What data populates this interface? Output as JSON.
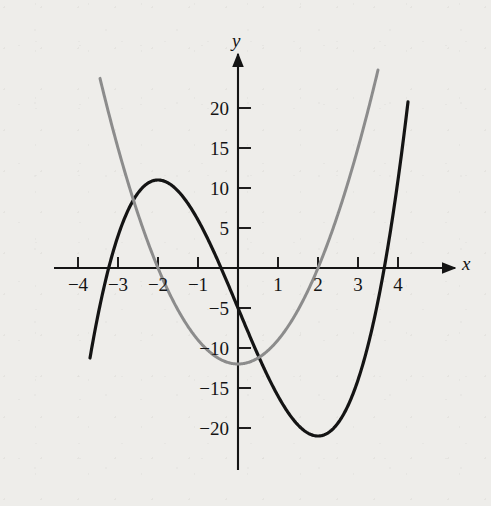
{
  "chart_data": {
    "type": "line",
    "title": "",
    "xlabel": "x",
    "ylabel": "y",
    "xlim": [
      -4.6,
      4.6
    ],
    "ylim": [
      -25.5,
      25.5
    ],
    "grid": false,
    "legend_position": "none",
    "x_ticks": [
      -4,
      -3,
      -2,
      -1,
      1,
      2,
      3,
      4
    ],
    "x_tick_labels": [
      "−4",
      "−3",
      "−2",
      "−1",
      "1",
      "2",
      "3",
      "4"
    ],
    "y_ticks": [
      20,
      15,
      10,
      5,
      -5,
      -10,
      -15,
      -20
    ],
    "y_tick_labels": [
      "20",
      "15",
      "10",
      "5",
      "−5",
      "−10",
      "−15",
      "−20"
    ],
    "series": [
      {
        "name": "cubic",
        "color": "#141414",
        "equation": "y = x^3 - 12x - 5",
        "linewidth": 3.2,
        "x_range": [
          -3.7,
          4.25
        ],
        "x": [
          -3.7,
          -3.5,
          -3.25,
          -3.0,
          -2.75,
          -2.5,
          -2.25,
          -2.0,
          -1.75,
          -1.5,
          -1.25,
          -1.0,
          -0.75,
          -0.5,
          -0.25,
          0.0,
          0.25,
          0.5,
          0.75,
          1.0,
          1.25,
          1.5,
          1.75,
          2.0,
          2.25,
          2.5,
          2.75,
          3.0,
          3.25,
          3.5,
          3.75,
          4.0,
          4.25
        ],
        "y": [
          -11.25,
          -5.38,
          4.67,
          4.0,
          7.45,
          9.38,
          10.61,
          11.0,
          10.64,
          9.63,
          8.05,
          6.0,
          3.58,
          0.88,
          -2.02,
          -5.0,
          -7.98,
          -10.88,
          -13.58,
          -16.0,
          -18.05,
          -19.63,
          -20.64,
          -21.0,
          -20.61,
          -19.38,
          -17.2,
          -14.0,
          -9.67,
          -4.13,
          2.75,
          11.0,
          20.77
        ]
      },
      {
        "name": "parabola",
        "color": "#8c8c8c",
        "equation": "y = 3x^2 - 12",
        "linewidth": 3.0,
        "x_range": [
          -3.45,
          3.5
        ],
        "x": [
          -3.45,
          -3.25,
          -3.0,
          -2.75,
          -2.5,
          -2.25,
          -2.0,
          -1.75,
          -1.5,
          -1.25,
          -1.0,
          -0.75,
          -0.5,
          -0.25,
          0.0,
          0.25,
          0.5,
          0.75,
          1.0,
          1.25,
          1.5,
          1.75,
          2.0,
          2.25,
          2.5,
          2.75,
          3.0,
          3.25,
          3.5
        ],
        "y": [
          23.71,
          19.69,
          15.0,
          10.69,
          6.75,
          3.19,
          0.0,
          -2.81,
          -5.25,
          -7.31,
          -9.0,
          -10.31,
          -11.25,
          -11.81,
          -12.0,
          -11.81,
          -11.25,
          -10.31,
          -9.0,
          -7.31,
          -5.25,
          -2.81,
          0.0,
          3.19,
          6.75,
          10.69,
          15.0,
          19.69,
          24.75
        ]
      }
    ],
    "annotations": {
      "cubic_local_max": {
        "x": -2,
        "y": 11
      },
      "cubic_local_min": {
        "x": 2,
        "y": -21
      },
      "parabola_vertex": {
        "x": 0,
        "y": -12
      },
      "parabola_roots": [
        -2,
        2
      ]
    }
  },
  "figure": {
    "background_color": "#eeedea",
    "axis_color": "#141414",
    "x_axis_label": "x",
    "y_axis_label": "y"
  }
}
